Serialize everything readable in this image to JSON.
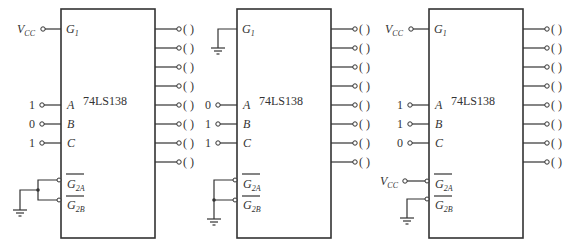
{
  "diagram": {
    "chip_label": "74LS138",
    "pin_labels": {
      "G1": "G",
      "G1_sub": "1",
      "A": "A",
      "B": "B",
      "C": "C",
      "G2A": "G",
      "G2A_sub": "2A",
      "G2B": "G",
      "G2B_sub": "2B"
    },
    "vcc_label": "V",
    "vcc_sub": "CC",
    "output_blank": "(   )",
    "circuits": [
      {
        "id": "circuit-1",
        "G1": "VCC",
        "inputs": {
          "A": "1",
          "B": "0",
          "C": "1"
        },
        "G2A": "GND",
        "G2B": "GND"
      },
      {
        "id": "circuit-2",
        "G1": "GND",
        "inputs": {
          "A": "0",
          "B": "1",
          "C": "1"
        },
        "G2A": "GND",
        "G2B": "GND"
      },
      {
        "id": "circuit-3",
        "G1": "VCC",
        "inputs": {
          "A": "1",
          "B": "1",
          "C": "0"
        },
        "G2A": "VCC",
        "G2B": "GND"
      }
    ],
    "outputs_per_chip": 8
  }
}
